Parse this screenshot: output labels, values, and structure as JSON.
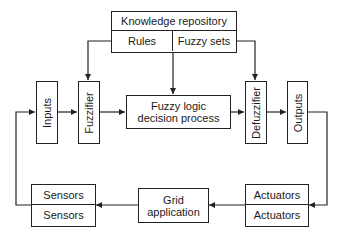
{
  "diagram": {
    "knowledge_repository": {
      "title": "Knowledge repository",
      "left": "Rules",
      "right": "Fuzzy sets"
    },
    "inputs": "Inputs",
    "fuzzifier": "Fuzzifier",
    "decision": {
      "line1": "Fuzzy logic",
      "line2": "decision process"
    },
    "defuzzifier": "Defuzzifier",
    "outputs": "Outputs",
    "sensors": {
      "top": "Sensors",
      "bottom": "Sensors"
    },
    "grid": {
      "line1": "Grid",
      "line2": "application"
    },
    "actuators": {
      "top": "Actuators",
      "bottom": "Actuators"
    },
    "colors": {
      "line": "#222222",
      "background": "#ffffff"
    }
  }
}
